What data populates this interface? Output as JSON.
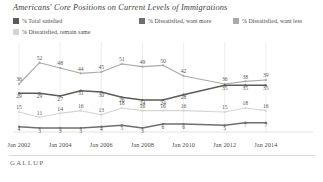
{
  "header": {
    "title": "Americans' Core Positions on Current Levels of Immigrations"
  },
  "legend": {
    "items": [
      {
        "label": "% Total satisfied",
        "color": "#5b5b59"
      },
      {
        "label": "% Dissatisfied, want more",
        "color": "#6f6f6d"
      },
      {
        "label": "% Dissatisfied, want less",
        "color": "#a9a9a6"
      },
      {
        "label": "% Dissatisfied, remain same",
        "color": "#d5d5d1"
      }
    ]
  },
  "footer": {
    "logo": "GALLUP"
  },
  "chart_data": {
    "type": "line",
    "title": "Americans' Core Positions on Current Levels of Immigrations",
    "xlabel": "",
    "ylabel": "",
    "ylim": [
      0,
      60
    ],
    "grid": true,
    "legend_position": "top",
    "x": [
      2002,
      2003,
      2004,
      2005,
      2006,
      2007,
      2008,
      2009,
      2010,
      2011,
      2012,
      2013,
      2014,
      2015,
      2016
    ],
    "tick_labels": [
      "Jan 2002",
      "Jan 2004",
      "Jan 2006",
      "Jan 2008",
      "Jan 2010",
      "Jan 2012",
      "Jan 2014"
    ],
    "tick_x": [
      2002,
      2004,
      2006,
      2008,
      2010,
      2012,
      2014
    ],
    "series": [
      {
        "name": "% Dissatisfied, want less",
        "color": "#a9a9a6",
        "values": [
          36,
          52,
          48,
          44,
          45,
          51,
          49,
          50,
          42,
          null,
          36,
          38,
          39,
          null,
          null
        ],
        "labels": [
          "36",
          "52",
          "48",
          "44",
          "45",
          "51",
          "49",
          "50",
          "42",
          "",
          "36",
          "38",
          "39",
          "",
          ""
        ]
      },
      {
        "name": "% Total satisfied",
        "color": "#5b5b59",
        "values": [
          29,
          29,
          27,
          31,
          30,
          26,
          24,
          24,
          28,
          null,
          35,
          35,
          35,
          null,
          null
        ],
        "labels": [
          "29",
          "29",
          "27",
          "31",
          "30",
          "26",
          "24",
          "24",
          "28",
          "",
          "35",
          "35",
          "35",
          "",
          ""
        ]
      },
      {
        "name": "% Dissatisfied, want more",
        "color": "#d5d5d1",
        "values": [
          15,
          11,
          14,
          16,
          13,
          18,
          16,
          16,
          16,
          null,
          15,
          18,
          16,
          null,
          null
        ],
        "labels": [
          "15",
          "11",
          "14",
          "16",
          "13",
          "18",
          "16",
          "16",
          "16",
          "",
          "15",
          "18",
          "16",
          "",
          ""
        ]
      },
      {
        "name": "% Dissatisfied, remain same",
        "color": "#6f6f6d",
        "values": [
          4,
          3,
          3,
          3,
          4,
          5,
          3,
          6,
          6,
          null,
          5,
          7,
          7,
          null,
          null
        ],
        "labels": [
          "4",
          "3",
          "3",
          "3",
          "4",
          "5",
          "3",
          "6",
          "6",
          "",
          "5",
          "7",
          "7",
          "",
          ""
        ]
      }
    ]
  }
}
